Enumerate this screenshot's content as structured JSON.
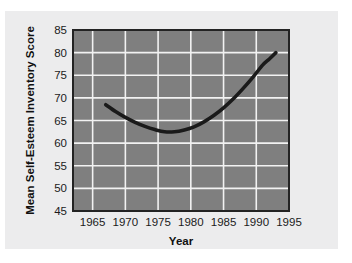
{
  "chart_data": {
    "type": "line",
    "title": "",
    "xlabel": "Year",
    "ylabel": "Mean Self-Esteem Inventory Score",
    "xlim": [
      1962,
      1995
    ],
    "ylim": [
      45,
      85
    ],
    "xticks": [
      1965,
      1970,
      1975,
      1980,
      1985,
      1990,
      1995
    ],
    "yticks": [
      45,
      50,
      55,
      60,
      65,
      70,
      75,
      80,
      85
    ],
    "xtick_labels": [
      "1965",
      "1970",
      "1975",
      "1980",
      "1985",
      "1990",
      "1995"
    ],
    "ytick_labels": [
      "45",
      "50",
      "55",
      "60",
      "65",
      "70",
      "75",
      "80",
      "85"
    ],
    "grid": true,
    "legend": null,
    "series": [
      {
        "name": "Mean Self-Esteem Inventory Score",
        "color": "#1a1a1a",
        "x": [
          1967.0,
          1968.5,
          1970.0,
          1971.5,
          1973.0,
          1974.5,
          1976.0,
          1977.5,
          1979.0,
          1980.5,
          1982.0,
          1983.5,
          1985.0,
          1986.5,
          1988.0,
          1989.5,
          1991.0,
          1992.0,
          1993.0
        ],
        "y": [
          68.5,
          67.0,
          65.7,
          64.6,
          63.7,
          63.0,
          62.5,
          62.5,
          62.9,
          63.6,
          64.7,
          66.1,
          67.8,
          69.8,
          72.1,
          74.6,
          77.3,
          78.6,
          80.0
        ]
      }
    ],
    "annotations": [],
    "colors": {
      "outer_background": "#ffffff",
      "panel_background": "#ececed",
      "plot_background": "#7f7f7f",
      "grid": "#f2f2f2",
      "frame": "#232323",
      "line": "#1a1a1a",
      "text": "#141414"
    }
  }
}
